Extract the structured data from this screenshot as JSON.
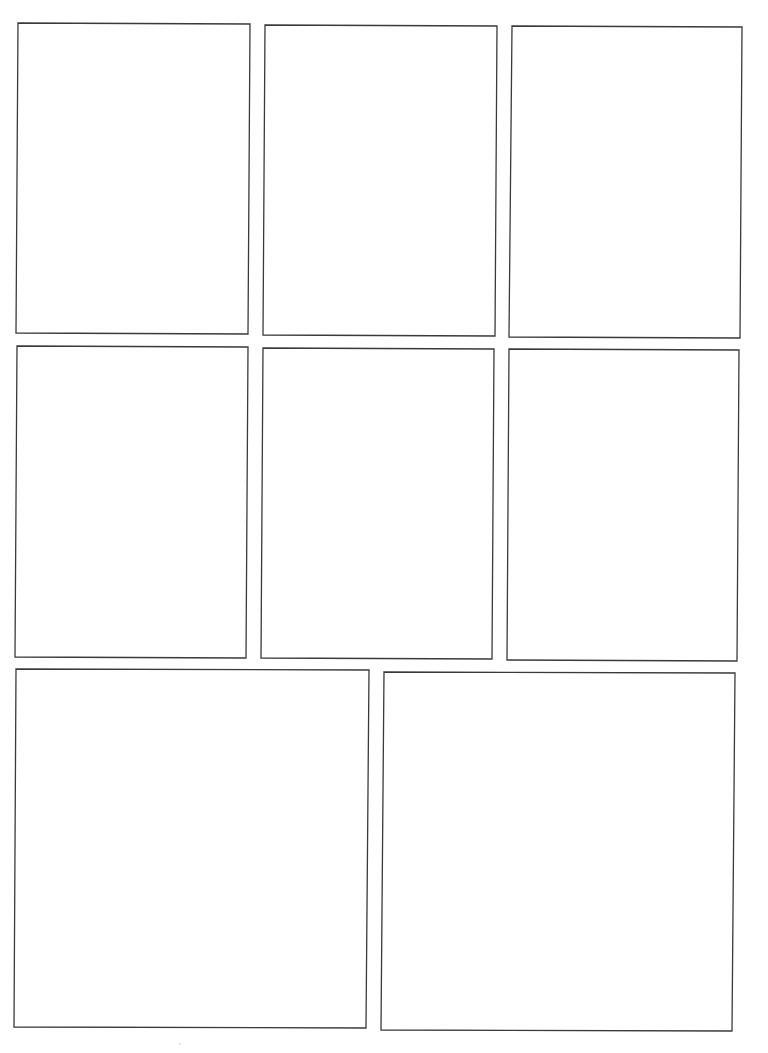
{
  "page": {
    "type": "blank-comic-panel-template",
    "width": 768,
    "height": 1053,
    "background": "#ffffff",
    "border_color": "#3a3a3a",
    "panel_count": 8,
    "rows": [
      {
        "row": 1,
        "panels": [
          1,
          2,
          3
        ]
      },
      {
        "row": 2,
        "panels": [
          4,
          5,
          6
        ]
      },
      {
        "row": 3,
        "panels": [
          7,
          8
        ]
      }
    ]
  },
  "panels": [
    {
      "id": 1,
      "points": "18,23 250,24 248,334 16,333"
    },
    {
      "id": 2,
      "points": "265,25 497,26 495,336 263,335"
    },
    {
      "id": 3,
      "points": "512,26 742,27 740,338 509,337"
    },
    {
      "id": 4,
      "points": "17,346 248,347 246,658 15,657"
    },
    {
      "id": 5,
      "points": "263,348 494,349 492,659 261,658"
    },
    {
      "id": 6,
      "points": "509,349 739,350 737,661 507,660"
    },
    {
      "id": 7,
      "points": "16,669 369,670 366,1028 14,1027"
    },
    {
      "id": 8,
      "points": "384,672 735,673 732,1031 381,1030"
    }
  ]
}
